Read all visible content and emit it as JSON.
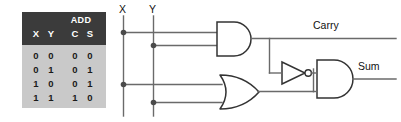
{
  "diagram": {
    "line_color": "#555555",
    "gate_stroke": "#333333",
    "table_header_bg": "#3b3b3b",
    "table_body_bg": "#c9c9c9"
  },
  "truth_table": {
    "group_header": "ADD",
    "columns": [
      "X",
      "Y",
      "C",
      "S"
    ],
    "rows": [
      [
        "0",
        "0",
        "0",
        "0"
      ],
      [
        "0",
        "1",
        "0",
        "1"
      ],
      [
        "1",
        "0",
        "0",
        "1"
      ],
      [
        "1",
        "1",
        "1",
        "0"
      ]
    ]
  },
  "inputs": [
    {
      "name": "x-input",
      "label": "X"
    },
    {
      "name": "y-input",
      "label": "Y"
    }
  ],
  "outputs": [
    {
      "name": "carry-output",
      "label": "Carry"
    },
    {
      "name": "sum-output",
      "label": "Sum"
    }
  ],
  "gates": [
    {
      "name": "and-gate-carry",
      "type": "AND"
    },
    {
      "name": "or-gate",
      "type": "OR"
    },
    {
      "name": "not-gate",
      "type": "NOT"
    },
    {
      "name": "and-gate-sum",
      "type": "AND"
    }
  ]
}
